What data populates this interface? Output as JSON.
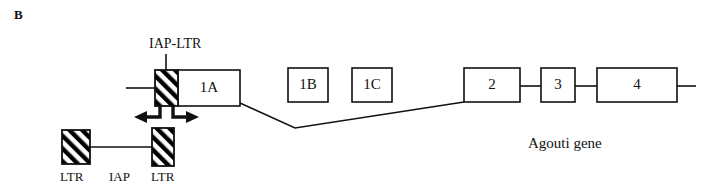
{
  "figure": {
    "panel_label": "B",
    "gene_label": "Agouti gene",
    "iap_ltr_label": "IAP-LTR",
    "insertion_labels": {
      "ltr_left": "LTR",
      "iap": "IAP",
      "ltr_right": "LTR"
    },
    "colors": {
      "stroke": "#111111",
      "fill": "#ffffff",
      "hatch": "#000000"
    }
  },
  "exons": [
    {
      "label": "1A",
      "x": 178,
      "y": 70,
      "w": 62,
      "h": 36
    },
    {
      "label": "1B",
      "x": 288,
      "y": 68,
      "w": 40,
      "h": 34
    },
    {
      "label": "1C",
      "x": 352,
      "y": 68,
      "w": 40,
      "h": 34
    },
    {
      "label": "2",
      "x": 464,
      "y": 68,
      "w": 56,
      "h": 34
    },
    {
      "label": "3",
      "x": 541,
      "y": 68,
      "w": 34,
      "h": 34
    },
    {
      "label": "4",
      "x": 597,
      "y": 68,
      "w": 80,
      "h": 34
    }
  ],
  "ltr_boxes": [
    {
      "name": "iap-ltr-inserted",
      "x": 155,
      "y": 70,
      "w": 23,
      "h": 36
    },
    {
      "name": "ltr-left-lower",
      "x": 62,
      "y": 130,
      "w": 28,
      "h": 34
    },
    {
      "name": "ltr-right-lower",
      "x": 152,
      "y": 128,
      "w": 22,
      "h": 38
    }
  ],
  "arrows": {
    "left_direction": "left",
    "right_direction": "right",
    "description": "bidirectional transcription arrows"
  },
  "connectors": {
    "upstream_line": "horizontal line entering IAP-LTR from left",
    "splice_line": "V-shaped intron line from exon 1A to exon 2",
    "downstream_tail": "short line right of exon 4",
    "iap_internal_line": "horizontal line joining the two lower LTR boxes"
  }
}
